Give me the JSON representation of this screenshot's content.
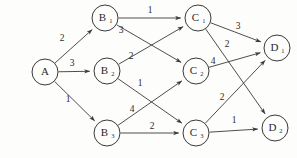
{
  "diagram": {
    "title": "",
    "type": "directed-weighted-network",
    "colors": {
      "background": "#fdfdfc",
      "stroke": "#3a3a3a",
      "text": "#2b2b2b"
    },
    "nodes": [
      {
        "id": "A",
        "base": "A",
        "sub": "",
        "cx": 45,
        "cy": 72,
        "r": 13
      },
      {
        "id": "B1",
        "base": "B",
        "sub": "1",
        "cx": 105,
        "cy": 18,
        "r": 13
      },
      {
        "id": "B2",
        "base": "B",
        "sub": "2",
        "cx": 107,
        "cy": 71,
        "r": 13
      },
      {
        "id": "B3",
        "base": "B",
        "sub": "3",
        "cx": 107,
        "cy": 133,
        "r": 13
      },
      {
        "id": "C1",
        "base": "C",
        "sub": "1",
        "cx": 198,
        "cy": 18,
        "r": 13
      },
      {
        "id": "C2",
        "base": "C",
        "sub": "2",
        "cx": 196,
        "cy": 71,
        "r": 13
      },
      {
        "id": "C3",
        "base": "C",
        "sub": "3",
        "cx": 196,
        "cy": 133,
        "r": 13
      },
      {
        "id": "D1",
        "base": "D",
        "sub": "1",
        "cx": 277,
        "cy": 48,
        "r": 13
      },
      {
        "id": "D2",
        "base": "D",
        "sub": "2",
        "cx": 275,
        "cy": 128,
        "r": 13
      }
    ],
    "edges": [
      {
        "from": "A",
        "to": "B1",
        "weight": "2",
        "lx": 62,
        "ly": 39
      },
      {
        "from": "A",
        "to": "B2",
        "weight": "3",
        "lx": 72,
        "ly": 64
      },
      {
        "from": "A",
        "to": "B3",
        "weight": "1",
        "lx": 68,
        "ly": 100
      },
      {
        "from": "B1",
        "to": "C1",
        "weight": "1",
        "lx": 150,
        "ly": 11
      },
      {
        "from": "B1",
        "to": "C2",
        "weight": "3",
        "lx": 121,
        "ly": 31
      },
      {
        "from": "B2",
        "to": "C1",
        "weight": "2",
        "lx": 131,
        "ly": 57
      },
      {
        "from": "B2",
        "to": "C3",
        "weight": "1",
        "lx": 140,
        "ly": 84
      },
      {
        "from": "B3",
        "to": "C2",
        "weight": "4",
        "lx": 132,
        "ly": 110
      },
      {
        "from": "B3",
        "to": "C3",
        "weight": "2",
        "lx": 152,
        "ly": 127
      },
      {
        "from": "C1",
        "to": "D1",
        "weight": "3",
        "lx": 238,
        "ly": 27
      },
      {
        "from": "C1",
        "to": "D2",
        "weight": "2",
        "lx": 227,
        "ly": 45
      },
      {
        "from": "C2",
        "to": "D1",
        "weight": "4",
        "lx": 213,
        "ly": 62
      },
      {
        "from": "C3",
        "to": "D1",
        "weight": "2",
        "lx": 222,
        "ly": 98
      },
      {
        "from": "C3",
        "to": "D2",
        "weight": "1",
        "lx": 234,
        "ly": 121
      }
    ]
  }
}
